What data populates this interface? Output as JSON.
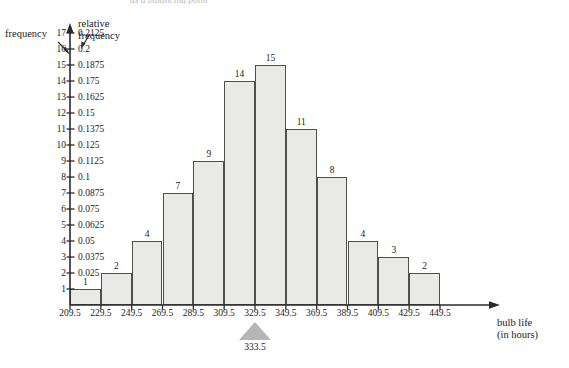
{
  "caption": "as a balancing point",
  "axes": {
    "y_left_title": "frequency",
    "y_right_title": "relative\nfrequency",
    "y_right_title_line1": "relative",
    "y_right_title_line2": "frequency",
    "x_title_line1": "bulb life",
    "x_title_line2": "(in hours)"
  },
  "balance_point": {
    "value": "333.5",
    "x": 329.5
  },
  "chart_data": {
    "type": "bar",
    "title": "",
    "subtitle": "as a balancing point",
    "xlabel": "bulb life (in hours)",
    "ylabel": "frequency",
    "y2label": "relative frequency",
    "grid": false,
    "legend": "none",
    "bin_edges": [
      209.5,
      229.5,
      249.5,
      269.5,
      289.5,
      309.5,
      329.5,
      349.5,
      369.5,
      389.5,
      409.5,
      429.5,
      449.5
    ],
    "bin_edge_labels": [
      "209.5",
      "229.5",
      "249.5",
      "269.5",
      "289.5",
      "309.5",
      "329.5",
      "349.5",
      "369.5",
      "389.5",
      "409.5",
      "429.5",
      "449.5"
    ],
    "values": [
      1,
      2,
      4,
      7,
      9,
      14,
      15,
      11,
      8,
      4,
      3,
      2
    ],
    "bar_labels": [
      "1",
      "2",
      "4",
      "7",
      "9",
      "14",
      "15",
      "11",
      "8",
      "4",
      "3",
      "2"
    ],
    "relative_frequencies": [
      0.0125,
      0.025,
      0.05,
      0.0875,
      0.1125,
      0.175,
      0.1875,
      0.1375,
      0.1,
      0.05,
      0.0375,
      0.025
    ],
    "ylim": [
      0,
      17
    ],
    "xlim": [
      209.5,
      449.5
    ],
    "total": 80,
    "balance_point": 333.5,
    "yticks": [
      {
        "frequency": "17",
        "relative_frequency": "0.2125"
      },
      {
        "frequency": "16",
        "relative_frequency": "0.2"
      },
      {
        "frequency": "15",
        "relative_frequency": "0.1875"
      },
      {
        "frequency": "14",
        "relative_frequency": "0.175"
      },
      {
        "frequency": "13",
        "relative_frequency": "0.1625"
      },
      {
        "frequency": "12",
        "relative_frequency": "0.15"
      },
      {
        "frequency": "11",
        "relative_frequency": "0.1375"
      },
      {
        "frequency": "10",
        "relative_frequency": "0.125"
      },
      {
        "frequency": "9",
        "relative_frequency": "0.1125"
      },
      {
        "frequency": "8",
        "relative_frequency": "0.1"
      },
      {
        "frequency": "7",
        "relative_frequency": "0.0875"
      },
      {
        "frequency": "6",
        "relative_frequency": "0.075"
      },
      {
        "frequency": "5",
        "relative_frequency": "0.0625"
      },
      {
        "frequency": "4",
        "relative_frequency": "0.05"
      },
      {
        "frequency": "3",
        "relative_frequency": "0.0375"
      },
      {
        "frequency": "2",
        "relative_frequency": "0.025"
      },
      {
        "frequency": "1",
        "relative_frequency": ""
      }
    ]
  },
  "colors": {
    "bar_fill": "#e9e9e7",
    "bar_stroke": "#4f4f4f",
    "axis": "#2b2b2b",
    "marker": "#b6b6b4",
    "background": "#ffffff"
  }
}
